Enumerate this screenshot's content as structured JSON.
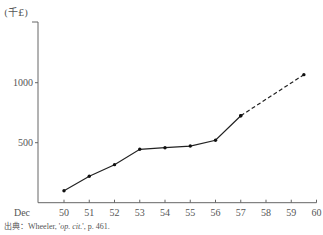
{
  "chart_data": {
    "type": "line",
    "title": "",
    "unit_label": "(千£)",
    "xlabel": "",
    "ylabel": "(千£)",
    "x_first_label": "Dec",
    "x_ticks": [
      50,
      51,
      52,
      53,
      54,
      55,
      56,
      57,
      58,
      59,
      60
    ],
    "y_ticks": [
      500,
      1000
    ],
    "ylim": [
      0,
      1200
    ],
    "xlim": [
      49.5,
      60
    ],
    "grid": false,
    "series": [
      {
        "name": "actual",
        "style": "solid",
        "x": [
          50,
          51,
          52,
          53,
          54,
          55,
          56,
          57
        ],
        "values": [
          100,
          220,
          317,
          445,
          458,
          472,
          520,
          725
        ]
      },
      {
        "name": "projected",
        "style": "dashed",
        "x": [
          57,
          59.5
        ],
        "values": [
          725,
          1067
        ]
      }
    ]
  },
  "source": {
    "prefix": "出典：Wheeler, '",
    "italic": "op. cit.",
    "suffix": "', p. 461."
  }
}
